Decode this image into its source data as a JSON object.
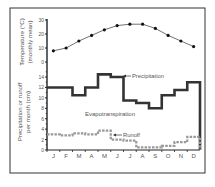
{
  "chart_data": [
    {
      "type": "line",
      "title": "",
      "ylabel": "Temperature (°C) (monthly mean)",
      "ylabel_lines": [
        "Temperature (°C)",
        "(monthly mean)"
      ],
      "xlabel": "",
      "categories": [
        "J",
        "F",
        "M",
        "A",
        "M",
        "J",
        "J",
        "A",
        "S",
        "O",
        "N",
        "D"
      ],
      "values": [
        8,
        10,
        15,
        19,
        23,
        26,
        27,
        27,
        24,
        19,
        15,
        11
      ],
      "ylim": [
        0,
        30
      ],
      "yticks": [
        0,
        10,
        20,
        30
      ],
      "grid": false,
      "marker": "circle"
    },
    {
      "type": "line",
      "step": true,
      "title": "",
      "ylabel": "Precipitation or runoff per month (cm)",
      "ylabel_lines": [
        "Precipitation or runoff",
        "per month (cm)"
      ],
      "xlabel": "",
      "categories": [
        "J",
        "F",
        "M",
        "A",
        "M",
        "J",
        "J",
        "A",
        "S",
        "O",
        "N",
        "D"
      ],
      "ylim": [
        0,
        15
      ],
      "yticks": [
        0,
        2,
        4,
        6,
        8,
        10,
        12,
        14
      ],
      "grid": false,
      "series": [
        {
          "name": "Precipitation",
          "style": "solid-thick",
          "color": "#333333",
          "values": [
            12,
            12,
            10.5,
            12,
            14.5,
            14,
            9.5,
            9,
            8,
            10.5,
            11.5,
            13
          ]
        },
        {
          "name": "Runoff",
          "style": "dashed-gray",
          "color": "#999999",
          "values": [
            3,
            2.8,
            3.2,
            3,
            3.7,
            2,
            1.8,
            0.5,
            0.5,
            0.8,
            1.5,
            2.5
          ]
        }
      ],
      "annotations": [
        "Precipitation",
        "Evapotranspiration",
        "Runoff"
      ]
    }
  ]
}
